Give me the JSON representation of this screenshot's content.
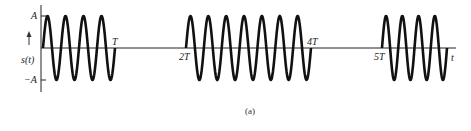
{
  "figure": {
    "caption": "(a)",
    "y_axis_label": "s(t)",
    "x_axis_label": "t",
    "amplitude_labels": {
      "positive": "A",
      "negative": "−A"
    },
    "time_markers": [
      {
        "label": "T"
      },
      {
        "label": "2T"
      },
      {
        "label": "4T"
      },
      {
        "label": "5T"
      }
    ],
    "bursts": [
      {
        "start": "0",
        "end": "T",
        "cycles": 4
      },
      {
        "start": "2T",
        "end": "4T",
        "cycles": 7
      },
      {
        "start": "5T",
        "end": "",
        "cycles": 4
      }
    ],
    "colors": {
      "line": "#111111",
      "background": "#ffffff"
    }
  }
}
